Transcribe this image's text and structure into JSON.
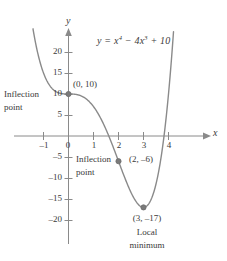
{
  "figure": {
    "title": "",
    "equation_label": {
      "prefix": "y = x",
      "exp1": "4",
      "mid": " − 4x",
      "exp2": "3",
      "suffix": " + 10",
      "plain": "y = x^4 - 4x^3 + 10"
    },
    "axis_x_name": "x",
    "axis_y_name": "y"
  },
  "annotations": {
    "inflection1_line1": "Inflection",
    "inflection1_line2": "point",
    "inflection1_coord": "(0, 10)",
    "inflection2_line1": "Inflection",
    "inflection2_line2": "point",
    "inflection2_coord": "(2, –6)",
    "minimum_coord": "(3, –17)",
    "minimum_line1": "Local",
    "minimum_line2": "minimum"
  },
  "colors": {
    "curve": "#8a8a8a",
    "axis": "#8a8a8a",
    "text": "#3a3a3a",
    "background": "#ffffff",
    "point": "#7a7a7a"
  },
  "chart_data": {
    "type": "line",
    "xlabel": "x",
    "ylabel": "y",
    "xlim": [
      -1.6,
      4.3
    ],
    "ylim": [
      -23,
      25
    ],
    "xticks": [
      -1,
      0,
      1,
      2,
      3,
      4
    ],
    "xtick_labels": [
      "–1",
      "0",
      "1",
      "2",
      "3",
      "4"
    ],
    "yticks": [
      -20,
      -15,
      -10,
      -5,
      5,
      10,
      15,
      20
    ],
    "ytick_labels": [
      "–20",
      "–15",
      "–10",
      "–5",
      "5",
      "10",
      "15",
      "20"
    ],
    "grid": false,
    "legend": false,
    "function": "y = x^4 - 4x^3 + 10",
    "series": [
      {
        "name": "y = x^4 - 4x^3 + 10",
        "x": [
          -1.45,
          -1.3,
          -1.2,
          -1.1,
          -1.0,
          -0.9,
          -0.8,
          -0.7,
          -0.6,
          -0.5,
          -0.4,
          -0.3,
          -0.2,
          -0.1,
          0.0,
          0.2,
          0.4,
          0.6,
          0.8,
          1.0,
          1.2,
          1.4,
          1.6,
          1.8,
          2.0,
          2.2,
          2.4,
          2.6,
          2.8,
          3.0,
          3.2,
          3.4,
          3.6,
          3.8,
          4.0,
          4.1,
          4.15
        ],
        "y": [
          26.6,
          20.6,
          16.9,
          14.0,
          15.0,
          13.6,
          12.5,
          11.6,
          11.0,
          10.6,
          10.3,
          10.1,
          10.0,
          10.0,
          10.0,
          9.97,
          9.72,
          9.03,
          7.77,
          7.0,
          4.61,
          2.87,
          1.11,
          -0.83,
          -6.0,
          -6.03,
          -11.1,
          -13.3,
          -15.3,
          -17.0,
          -13.1,
          -13.4,
          -8.6,
          -2.5,
          10.0,
          17.2,
          21.9
        ]
      }
    ],
    "marked_points": [
      {
        "x": 0,
        "y": 10,
        "label": "(0, 10)",
        "kind": "inflection point"
      },
      {
        "x": 2,
        "y": -6,
        "label": "(2, –6)",
        "kind": "inflection point"
      },
      {
        "x": 3,
        "y": -17,
        "label": "(3, –17)",
        "kind": "local minimum"
      }
    ]
  }
}
